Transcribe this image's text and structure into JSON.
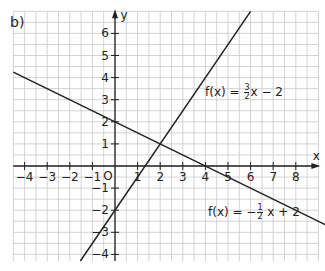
{
  "figure": {
    "part_label": "b)",
    "x_axis_label": "x",
    "y_axis_label": "y",
    "origin_label": "O",
    "x_ticks": [
      -4,
      -3,
      -2,
      -1,
      1,
      2,
      3,
      4,
      5,
      6,
      7,
      8
    ],
    "y_ticks": [
      6,
      5,
      4,
      3,
      2,
      1,
      -1,
      -2,
      -3,
      -4
    ],
    "x_range": [
      -4.5,
      9
    ],
    "y_range": [
      -4.3,
      7
    ],
    "grid_step": 0.5,
    "colors": {
      "grid": "#c8c8c8",
      "axis": "#222222",
      "line": "#222222"
    },
    "functions": [
      {
        "label_prefix": "f(x) = ",
        "num": "3",
        "den": "2",
        "label_suffix": "x − 2",
        "slope": 1.5,
        "intercept": -2
      },
      {
        "label_prefix": "f(x) = −",
        "num": "1",
        "den": "2",
        "label_suffix": " x + 2",
        "slope": -0.5,
        "intercept": 2
      }
    ],
    "intersection": {
      "x": 2,
      "y": 1
    }
  }
}
